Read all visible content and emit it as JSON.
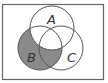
{
  "diagram": {
    "type": "venn",
    "sets": [
      {
        "label": "A",
        "cx": 52,
        "cy": 28,
        "r": 22
      },
      {
        "label": "B",
        "cx": 40,
        "cy": 48,
        "r": 22
      },
      {
        "label": "C",
        "cx": 61,
        "cy": 48,
        "r": 22
      }
    ],
    "shaded_region": "B − A",
    "shade_color": "#8a8a8a",
    "stroke_color": "#555555"
  }
}
